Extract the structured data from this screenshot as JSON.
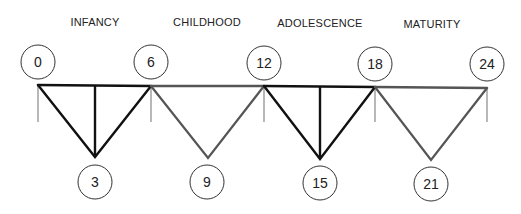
{
  "diagram": {
    "type": "life-stage truss timeline",
    "colors": {
      "dark_segment": "#111111",
      "light_segment": "#555555",
      "tick": "#888888",
      "text": "#222222",
      "circle_stroke": "#333333"
    },
    "stages": [
      {
        "label": "INFANCY",
        "x": 95,
        "y": 22,
        "style": "dark",
        "has_center_line": true
      },
      {
        "label": "CHILDHOOD",
        "x": 207,
        "y": 22,
        "style": "light",
        "has_center_line": false
      },
      {
        "label": "ADOLESCENCE",
        "x": 320,
        "y": 23,
        "style": "dark",
        "has_center_line": true
      },
      {
        "label": "MATURITY",
        "x": 432,
        "y": 24,
        "style": "light",
        "has_center_line": false
      }
    ],
    "top_nodes": [
      {
        "label": "0",
        "cx": 38,
        "cy": 62,
        "bar_x": 38,
        "bar_y": 85
      },
      {
        "label": "6",
        "cx": 151,
        "cy": 62,
        "bar_x": 151,
        "bar_y": 86
      },
      {
        "label": "12",
        "cx": 264,
        "cy": 63,
        "bar_x": 264,
        "bar_y": 86
      },
      {
        "label": "18",
        "cx": 375,
        "cy": 64,
        "bar_x": 375,
        "bar_y": 87
      },
      {
        "label": "24",
        "cx": 487,
        "cy": 64,
        "bar_x": 487,
        "bar_y": 88
      }
    ],
    "bottom_nodes": [
      {
        "label": "3",
        "cx": 95,
        "cy": 182,
        "apex_x": 95,
        "apex_y": 157
      },
      {
        "label": "9",
        "cx": 207,
        "cy": 182,
        "apex_x": 208,
        "apex_y": 158
      },
      {
        "label": "15",
        "cx": 320,
        "cy": 183,
        "apex_x": 320,
        "apex_y": 159
      },
      {
        "label": "21",
        "cx": 431,
        "cy": 184,
        "apex_x": 431,
        "apex_y": 160
      }
    ],
    "tick_bottom_y": 122,
    "circle_radius": 17
  }
}
